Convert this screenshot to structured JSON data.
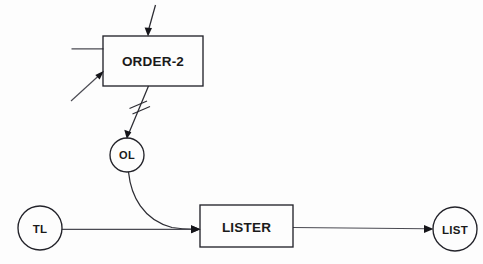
{
  "diagram": {
    "background_color": "#fdfdfd",
    "stroke_color": "#23232a",
    "edge_color": "#4a4a52",
    "nodes": [
      {
        "id": "order2",
        "label": "ORDER-2",
        "shape": "rectangle",
        "x": 103,
        "y": 36,
        "width": 100,
        "height": 50
      },
      {
        "id": "ol",
        "label": "OL",
        "shape": "circle",
        "cx": 127,
        "cy": 155,
        "r": 17
      },
      {
        "id": "tl",
        "label": "TL",
        "shape": "circle",
        "cx": 40,
        "cy": 228,
        "r": 22
      },
      {
        "id": "lister",
        "label": "LISTER",
        "shape": "rectangle",
        "x": 200,
        "y": 205,
        "width": 93,
        "height": 42
      },
      {
        "id": "list",
        "label": "LIST",
        "shape": "circle",
        "cx": 455,
        "cy": 229,
        "r": 22
      }
    ],
    "edges": [
      {
        "id": "edge-top-into-order2",
        "from": "",
        "to": "order2",
        "style": "straight",
        "arrow": true,
        "marks": 0
      },
      {
        "id": "edge-left-flat-into-order2",
        "from": "",
        "to": "order2",
        "style": "straight",
        "arrow": false,
        "marks": 0
      },
      {
        "id": "edge-left-diagonal-into-order2",
        "from": "",
        "to": "order2",
        "style": "straight",
        "arrow": true,
        "marks": 0
      },
      {
        "id": "edge-order2-to-ol",
        "from": "order2",
        "to": "ol",
        "style": "straight",
        "arrow": true,
        "marks": 2
      },
      {
        "id": "edge-ol-to-lister",
        "from": "ol",
        "to": "lister",
        "style": "curved",
        "arrow": true,
        "marks": 0
      },
      {
        "id": "edge-tl-to-lister",
        "from": "tl",
        "to": "lister",
        "style": "straight",
        "arrow": true,
        "marks": 0
      },
      {
        "id": "edge-lister-to-list",
        "from": "lister",
        "to": "list",
        "style": "straight",
        "arrow": true,
        "marks": 0
      }
    ]
  }
}
